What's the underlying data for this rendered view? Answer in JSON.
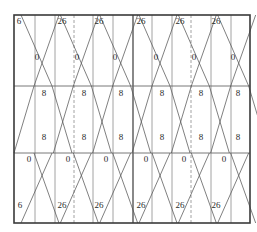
{
  "title": "",
  "grid": {
    "rows": 3,
    "units": 4,
    "subcolumns_per_unit": 3,
    "dashed_dividers": [
      "unit-1-right",
      "unit-3-right"
    ],
    "center_divider": "unit-2-right"
  },
  "labels": {
    "top_edge": [
      "6",
      "26",
      "26",
      "26",
      "26",
      "26"
    ],
    "top_row_crossings": [
      "0",
      "0",
      "0",
      "0",
      "0",
      "0"
    ],
    "middle_row_upper": [
      "8",
      "8",
      "8",
      "8",
      "8",
      "8"
    ],
    "middle_row_lower": [
      "8",
      "8",
      "8",
      "8",
      "8",
      "8"
    ],
    "bottom_row_crossings": [
      "0",
      "0",
      "0",
      "0",
      "0",
      "0"
    ],
    "bottom_edge": [
      "6",
      "26",
      "26",
      "26",
      "26",
      "26"
    ]
  },
  "colors": {
    "frame": "#3a3a3a",
    "lines": "#555555",
    "text": "#2a2a2a",
    "background": "#ffffff"
  }
}
